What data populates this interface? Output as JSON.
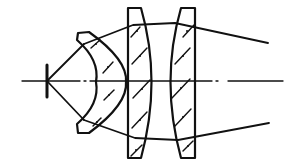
{
  "diagram": {
    "type": "optical-lens-system",
    "elements": [
      {
        "name": "object-point-stop"
      },
      {
        "name": "meniscus-lens"
      },
      {
        "name": "plano-convex-lens-1"
      },
      {
        "name": "plano-convex-lens-2"
      }
    ],
    "axis": "optical-axis",
    "colors": {
      "stroke": "#111111",
      "background": "#ffffff"
    }
  }
}
